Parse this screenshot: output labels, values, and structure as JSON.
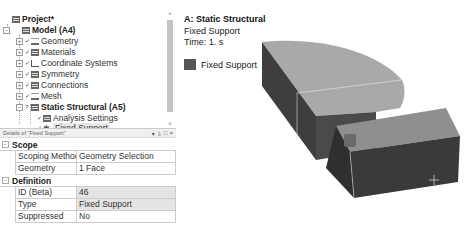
{
  "tree": {
    "items": [
      {
        "label": "Project*",
        "bold": true,
        "level": 0,
        "icon": "project-icon",
        "expander": ""
      },
      {
        "label": "Model (A4)",
        "bold": true,
        "level": 1,
        "icon": "model-icon",
        "expander": "−"
      },
      {
        "label": "Geometry",
        "level": 2,
        "icon": "geometry-icon",
        "expander": "+",
        "check": "✓"
      },
      {
        "label": "Materials",
        "level": 2,
        "icon": "materials-icon",
        "expander": "+",
        "check": "✓"
      },
      {
        "label": "Coordinate Systems",
        "level": 2,
        "icon": "coordinate-systems-icon",
        "expander": "+",
        "check": "✓"
      },
      {
        "label": "Symmetry",
        "level": 2,
        "icon": "symmetry-icon",
        "expander": "+",
        "check": "✓"
      },
      {
        "label": "Connections",
        "level": 2,
        "icon": "connections-icon",
        "expander": "+",
        "check": "✓"
      },
      {
        "label": "Mesh",
        "level": 2,
        "icon": "mesh-icon",
        "expander": "+",
        "check": "✓"
      },
      {
        "label": "Static Structural (A5)",
        "bold": true,
        "level": 2,
        "icon": "static-structural-icon",
        "expander": "−",
        "check": "?"
      },
      {
        "label": "Analysis Settings",
        "level": 3,
        "icon": "analysis-settings-icon",
        "check": "✓"
      },
      {
        "label": "Fixed Support",
        "level": 3,
        "icon": "fixed-support-icon",
        "check": "✓",
        "selected": true
      }
    ]
  },
  "details": {
    "title": "Details of \"Fixed Support\"",
    "header_buttons": {
      "pin": "▾",
      "autohide": "⇩",
      "maximize": "□",
      "close": "×"
    },
    "sections": [
      {
        "name": "Scope",
        "rows": [
          {
            "name": "Scoping Method",
            "value": "Geometry Selection",
            "shaded": false
          },
          {
            "name": "Geometry",
            "value": "1 Face",
            "shaded": false
          }
        ]
      },
      {
        "name": "Definition",
        "rows": [
          {
            "name": "ID (Beta)",
            "value": "46",
            "shaded": true
          },
          {
            "name": "Type",
            "value": "Fixed Support",
            "shaded": true
          },
          {
            "name": "Suppressed",
            "value": "No",
            "shaded": false
          }
        ]
      }
    ]
  },
  "viewport": {
    "title": "A: Static Structural",
    "subtitle": "Fixed Support",
    "time": "Time: 1. s",
    "legend": {
      "label": "Fixed Support",
      "color": "#555555"
    }
  },
  "colors": {
    "model_top": "#a9a9a9",
    "model_side": "#3e3e3e",
    "model_edge": "#d8d8d8",
    "fixed_face": "#6a6a6a"
  }
}
